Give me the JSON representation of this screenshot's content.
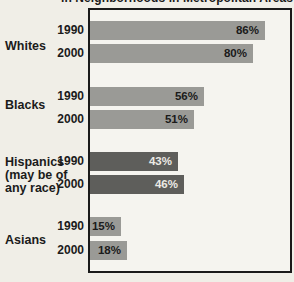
{
  "chart": {
    "title_visible": "in Neighborhoods in Metropolitan Areas",
    "colors": {
      "bg": "#f0eee7",
      "plotbg": "#f5f4ef",
      "border": "#1a1a1a",
      "barlight": "#9a9a96",
      "bardark": "#5e5e5b"
    },
    "groups": [
      {
        "label_lines": [
          "Whites"
        ],
        "bars": [
          {
            "year": "1990",
            "value": 86,
            "label": "86%"
          },
          {
            "year": "2000",
            "value": 80,
            "label": "80%"
          }
        ]
      },
      {
        "label_lines": [
          "Blacks"
        ],
        "bars": [
          {
            "year": "1990",
            "value": 56,
            "label": "56%"
          },
          {
            "year": "2000",
            "value": 51,
            "label": "51%"
          }
        ]
      },
      {
        "label_lines": [
          "Hispanics",
          "(may be of",
          "any race)"
        ],
        "bars": [
          {
            "year": "1990",
            "value": 43,
            "label": "43%"
          },
          {
            "year": "2000",
            "value": 46,
            "label": "46%"
          }
        ]
      },
      {
        "label_lines": [
          "Asians"
        ],
        "bars": [
          {
            "year": "1990",
            "value": 15,
            "label": "15%"
          },
          {
            "year": "2000",
            "value": 18,
            "label": "18%"
          }
        ]
      }
    ]
  },
  "chart_data": {
    "type": "bar",
    "orientation": "horizontal",
    "title": "in Neighborhoods in Metropolitan Areas",
    "categories": [
      "Whites",
      "Blacks",
      "Hispanics (may be of any race)",
      "Asians"
    ],
    "series": [
      {
        "name": "1990",
        "values": [
          86,
          56,
          43,
          15
        ]
      },
      {
        "name": "2000",
        "values": [
          80,
          51,
          46,
          18
        ]
      }
    ],
    "value_unit": "%",
    "xlim": [
      0,
      100
    ],
    "data_labels": true,
    "grid": false,
    "legend": "none"
  }
}
